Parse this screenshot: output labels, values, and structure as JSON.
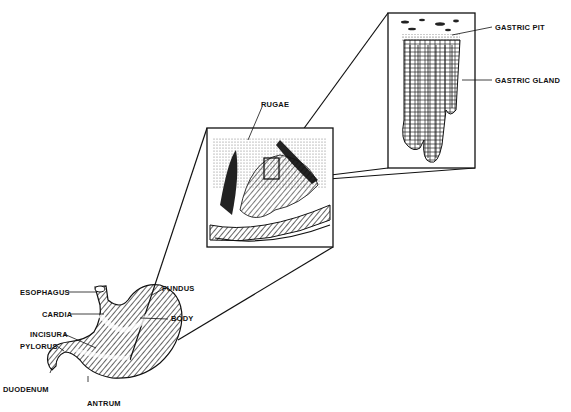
{
  "figure": {
    "labels": {
      "esophagus": "ESOPHAGUS",
      "cardia": "CARDIA",
      "incisura": "INCISURA",
      "pylorus": "PYLORUS",
      "duodenum": "DUODENUM",
      "antrum": "ANTRUM",
      "fundus": "FUNDUS",
      "body": "BODY",
      "rugae": "RUGAE",
      "gastric_pit": "GASTRIC PIT",
      "gastric_gland": "GASTRIC GLAND"
    },
    "colors": {
      "ink": "#111111",
      "background": "#ffffff"
    }
  }
}
